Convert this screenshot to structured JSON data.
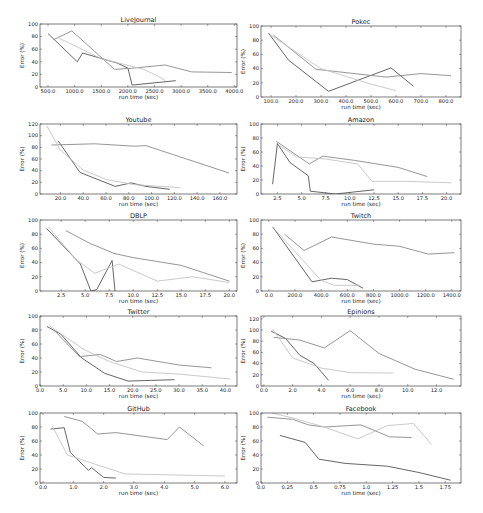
{
  "figure": {
    "width": 483,
    "height": 513,
    "line_colors": [
      "#555555",
      "#8a8a8a",
      "#c4c4c4"
    ],
    "frame_color": "#444444"
  },
  "chart_data": [
    {
      "type": "line",
      "title": "LiveJournal",
      "xlabel": "run time (sec)",
      "ylabel": "Error (%)",
      "xlim": [
        350,
        4050
      ],
      "ylim": [
        0,
        100
      ],
      "xticks": [
        500,
        1000,
        1500,
        2000,
        2500,
        3000,
        3500,
        4000
      ],
      "xtick_labels": [
        "500.0",
        "1000.0",
        "1500.0",
        "2000.0",
        "2500.0",
        "3000.0",
        "3500.0",
        "4000.0"
      ],
      "yticks": [
        0,
        20,
        40,
        60,
        80,
        100
      ],
      "ytick_labels": [
        "0",
        "20",
        "40",
        "60",
        "80",
        "100"
      ],
      "box": [
        40,
        24,
        237,
        87
      ],
      "series": [
        {
          "x": [
            500,
            1050,
            1150,
            1800,
            2000,
            2080,
            2900
          ],
          "y": [
            85,
            40,
            54,
            38,
            30,
            3,
            10
          ]
        },
        {
          "x": [
            600,
            950,
            1750,
            2100,
            2700,
            3200,
            3950
          ],
          "y": [
            75,
            89,
            28,
            30,
            35,
            24,
            23
          ]
        },
        {
          "x": [
            700,
            1500,
            2300,
            2550,
            2700
          ],
          "y": [
            78,
            45,
            28,
            18,
            10
          ]
        }
      ]
    },
    {
      "type": "line",
      "title": "Pokec",
      "xlabel": "run time (sec)",
      "ylabel": "Error (%)",
      "xlim": [
        60,
        860
      ],
      "ylim": [
        0,
        100
      ],
      "xticks": [
        100,
        200,
        300,
        400,
        500,
        600,
        700,
        800
      ],
      "xtick_labels": [
        "100.0",
        "200.0",
        "300.0",
        "400.0",
        "500.0",
        "600.0",
        "700.0",
        "800.0"
      ],
      "yticks": [
        0,
        20,
        40,
        60,
        80,
        100
      ],
      "ytick_labels": [
        "0",
        "20",
        "40",
        "60",
        "80",
        "100"
      ],
      "box": [
        261,
        26,
        461,
        97
      ],
      "series": [
        {
          "x": [
            90,
            170,
            330,
            580,
            670
          ],
          "y": [
            90,
            52,
            8,
            41,
            15
          ]
        },
        {
          "x": [
            110,
            280,
            560,
            700,
            820
          ],
          "y": [
            87,
            39,
            28,
            33,
            30
          ]
        },
        {
          "x": [
            95,
            300,
            500,
            600
          ],
          "y": [
            88,
            40,
            18,
            9
          ]
        }
      ]
    },
    {
      "type": "line",
      "title": "Youtube",
      "xlabel": "run time (sec)",
      "ylabel": "Error (%)",
      "xlim": [
        2,
        175
      ],
      "ylim": [
        0,
        120
      ],
      "xticks": [
        20,
        40,
        60,
        80,
        100,
        120,
        140,
        160
      ],
      "xtick_labels": [
        "20.0",
        "40.0",
        "60.0",
        "80.0",
        "100.0",
        "120.0",
        "140.0",
        "160.0"
      ],
      "yticks": [
        0,
        20,
        40,
        60,
        80,
        100,
        120
      ],
      "ytick_labels": [
        "0",
        "20",
        "40",
        "60",
        "80",
        "100",
        "120"
      ],
      "box": [
        40,
        124,
        237,
        194
      ],
      "series": [
        {
          "x": [
            18,
            37,
            68,
            82,
            95,
            116
          ],
          "y": [
            91,
            37,
            13,
            19,
            13,
            8
          ]
        },
        {
          "x": [
            12,
            50,
            85,
            95,
            168
          ],
          "y": [
            84,
            86,
            82,
            83,
            36
          ]
        },
        {
          "x": [
            8,
            20,
            40,
            60,
            85,
            125
          ],
          "y": [
            117,
            75,
            41,
            25,
            16,
            11
          ]
        }
      ]
    },
    {
      "type": "line",
      "title": "Amazon",
      "xlabel": "run time (sec)",
      "ylabel": "Error (%)",
      "xlim": [
        0.8,
        21.5
      ],
      "ylim": [
        0,
        100
      ],
      "xticks": [
        2.5,
        5.0,
        7.5,
        10.0,
        12.5,
        15.0,
        17.5,
        20.0
      ],
      "xtick_labels": [
        "2.5",
        "5.0",
        "7.5",
        "10.0",
        "12.5",
        "15.0",
        "17.5",
        "20.0"
      ],
      "yticks": [
        0,
        20,
        40,
        60,
        80,
        100
      ],
      "ytick_labels": [
        "0",
        "20",
        "40",
        "60",
        "80",
        "100"
      ],
      "box": [
        261,
        124,
        461,
        194
      ],
      "series": [
        {
          "x": [
            2.0,
            2.5,
            3.8,
            5.7,
            5.9,
            8.5,
            12.5
          ],
          "y": [
            14,
            72,
            45,
            26,
            4,
            0,
            6
          ]
        },
        {
          "x": [
            2.4,
            5.8,
            7.2,
            10.5,
            15.0,
            18.0
          ],
          "y": [
            75,
            43,
            54,
            48,
            38,
            25
          ]
        },
        {
          "x": [
            2.6,
            4.5,
            7.5,
            10.8,
            12.3,
            16.0,
            20.5
          ],
          "y": [
            70,
            53,
            50,
            43,
            18,
            18,
            16
          ]
        }
      ]
    },
    {
      "type": "line",
      "title": "DBLP",
      "xlabel": "run time (sec)",
      "ylabel": "Error (%)",
      "xlim": [
        0.3,
        20.8
      ],
      "ylim": [
        0,
        100
      ],
      "xticks": [
        2.5,
        5.0,
        7.5,
        10.0,
        12.5,
        15.0,
        17.5,
        20.0
      ],
      "xtick_labels": [
        "2.5",
        "5.0",
        "7.5",
        "10.0",
        "12.5",
        "15.0",
        "17.5",
        "20.0"
      ],
      "yticks": [
        0,
        20,
        40,
        60,
        80,
        100
      ],
      "ytick_labels": [
        "0",
        "20",
        "40",
        "60",
        "80",
        "100"
      ],
      "box": [
        40,
        220,
        237,
        291
      ],
      "series": [
        {
          "x": [
            1.0,
            4.5,
            5.6,
            6.2,
            7.8,
            8.1
          ],
          "y": [
            88,
            38,
            0,
            2,
            43,
            0
          ]
        },
        {
          "x": [
            3.0,
            5.5,
            8.0,
            10.0,
            15.0,
            20.0
          ],
          "y": [
            85,
            67,
            53,
            47,
            36,
            14
          ]
        },
        {
          "x": [
            1.2,
            4.0,
            6.0,
            8.5,
            12.5,
            16.2,
            20.0
          ],
          "y": [
            90,
            45,
            25,
            38,
            14,
            20,
            12
          ]
        }
      ]
    },
    {
      "type": "line",
      "title": "Twitch",
      "xlabel": "run time (sec)",
      "ylabel": "Error (%)",
      "xlim": [
        -60,
        1470
      ],
      "ylim": [
        0,
        100
      ],
      "xticks": [
        0,
        200,
        400,
        600,
        800,
        1000,
        1200,
        1400
      ],
      "xtick_labels": [
        "0.0",
        "200.0",
        "400.0",
        "600.0",
        "800.0",
        "1000.0",
        "1200.0",
        "1400.0"
      ],
      "yticks": [
        0,
        20,
        40,
        60,
        80,
        100
      ],
      "ytick_labels": [
        "0",
        "20",
        "40",
        "60",
        "80",
        "100"
      ],
      "box": [
        261,
        220,
        461,
        291
      ],
      "series": [
        {
          "x": [
            30,
            330,
            480,
            600,
            720
          ],
          "y": [
            90,
            13,
            18,
            16,
            4
          ]
        },
        {
          "x": [
            120,
            270,
            480,
            800,
            1000,
            1220,
            1420
          ],
          "y": [
            80,
            57,
            76,
            66,
            63,
            52,
            54
          ]
        },
        {
          "x": [
            40,
            400,
            500,
            700
          ],
          "y": [
            88,
            15,
            8,
            8
          ]
        }
      ]
    },
    {
      "type": "line",
      "title": "Twitter",
      "xlabel": "run time (sec)",
      "ylabel": "Error (%)",
      "xlim": [
        0,
        42.5
      ],
      "ylim": [
        0,
        100
      ],
      "xticks": [
        0,
        5,
        10,
        15,
        20,
        25,
        30,
        35,
        40
      ],
      "xtick_labels": [
        "0.0",
        "5.0",
        "10.0",
        "15.0",
        "20.0",
        "25.0",
        "30.0",
        "35.0",
        "40.0"
      ],
      "yticks": [
        0,
        20,
        40,
        60,
        80,
        100
      ],
      "ytick_labels": [
        "0",
        "20",
        "40",
        "60",
        "80",
        "100"
      ],
      "box": [
        40,
        316,
        237,
        386
      ],
      "series": [
        {
          "x": [
            1.5,
            4.5,
            9.0,
            14.0,
            19.0,
            24.0,
            29.0
          ],
          "y": [
            85,
            74,
            40,
            18,
            7,
            8,
            9
          ]
        },
        {
          "x": [
            3.0,
            8.5,
            13.0,
            16.5,
            21.0,
            30.0,
            37.0
          ],
          "y": [
            80,
            42,
            45,
            35,
            40,
            30,
            26
          ]
        },
        {
          "x": [
            2.0,
            9.5,
            15.0,
            22.0,
            30.0,
            41.0
          ],
          "y": [
            86,
            52,
            35,
            20,
            17,
            10
          ]
        }
      ]
    },
    {
      "type": "line",
      "title": "Epinions",
      "xlabel": "run time (sec)",
      "ylabel": "Error (%)",
      "xlim": [
        -0.2,
        13.7
      ],
      "ylim": [
        0,
        125
      ],
      "xticks": [
        0,
        2,
        4,
        6,
        8,
        10,
        12
      ],
      "xtick_labels": [
        "0.0",
        "2.0",
        "4.0",
        "6.0",
        "8.0",
        "10.0",
        "12.0"
      ],
      "yticks": [
        0,
        20,
        40,
        60,
        80,
        100,
        120
      ],
      "ytick_labels": [
        "0",
        "20",
        "40",
        "60",
        "80",
        "100",
        "120"
      ],
      "box": [
        261,
        316,
        461,
        386
      ],
      "series": [
        {
          "x": [
            0.5,
            1.5,
            2.5,
            3.5,
            4.5
          ],
          "y": [
            98,
            85,
            55,
            40,
            10
          ]
        },
        {
          "x": [
            0.7,
            2.5,
            4.2,
            6.0,
            8.0,
            10.5,
            13.2
          ],
          "y": [
            87,
            82,
            68,
            99,
            58,
            30,
            12
          ]
        },
        {
          "x": [
            0.6,
            2.0,
            4.0,
            6.0,
            9.0
          ],
          "y": [
            102,
            50,
            32,
            24,
            23
          ]
        }
      ]
    },
    {
      "type": "line",
      "title": "GitHub",
      "xlabel": "run time (sec)",
      "ylabel": "Error (%)",
      "xlim": [
        -0.1,
        6.4
      ],
      "ylim": [
        0,
        100
      ],
      "xticks": [
        0,
        1,
        2,
        3,
        4,
        5,
        6
      ],
      "xtick_labels": [
        "0.0",
        "1.0",
        "2.0",
        "3.0",
        "4.0",
        "5.0",
        "6.0"
      ],
      "yticks": [
        0,
        20,
        40,
        60,
        80,
        100
      ],
      "ytick_labels": [
        "0",
        "20",
        "40",
        "60",
        "80",
        "100"
      ],
      "box": [
        40,
        413,
        237,
        483
      ],
      "series": [
        {
          "x": [
            0.25,
            0.7,
            0.9,
            1.5,
            1.6,
            2.0,
            2.4
          ],
          "y": [
            77,
            79,
            44,
            18,
            22,
            8,
            7
          ]
        },
        {
          "x": [
            0.7,
            1.3,
            1.8,
            2.4,
            4.1,
            4.5,
            5.3
          ],
          "y": [
            95,
            88,
            70,
            72,
            62,
            80,
            53
          ]
        },
        {
          "x": [
            0.3,
            0.8,
            1.5,
            2.7,
            6.0
          ],
          "y": [
            82,
            40,
            30,
            13,
            10
          ]
        }
      ]
    },
    {
      "type": "line",
      "title": "Facebook",
      "xlabel": "run time (sec)",
      "ylabel": "Error (%)",
      "xlim": [
        0,
        1.9
      ],
      "ylim": [
        0,
        100
      ],
      "xticks": [
        0.0,
        0.25,
        0.5,
        0.75,
        1.0,
        1.25,
        1.5,
        1.75
      ],
      "xtick_labels": [
        "0.0",
        "0.25",
        "0.5",
        "0.75",
        "1.0",
        "1.25",
        "1.5",
        "1.75"
      ],
      "yticks": [
        0,
        20,
        40,
        60,
        80,
        100
      ],
      "ytick_labels": [
        "0",
        "20",
        "40",
        "60",
        "80",
        "100"
      ],
      "box": [
        261,
        413,
        461,
        483
      ],
      "series": [
        {
          "x": [
            0.18,
            0.42,
            0.55,
            0.8,
            1.2,
            1.5,
            1.8
          ],
          "y": [
            68,
            58,
            34,
            28,
            24,
            15,
            4
          ]
        },
        {
          "x": [
            0.06,
            0.3,
            0.45,
            0.6,
            0.95,
            1.22,
            1.43
          ],
          "y": [
            94,
            91,
            83,
            80,
            83,
            66,
            65
          ]
        },
        {
          "x": [
            0.1,
            0.3,
            0.6,
            0.92,
            1.2,
            1.45,
            1.62
          ],
          "y": [
            100,
            93,
            80,
            63,
            82,
            85,
            55
          ]
        }
      ]
    }
  ]
}
